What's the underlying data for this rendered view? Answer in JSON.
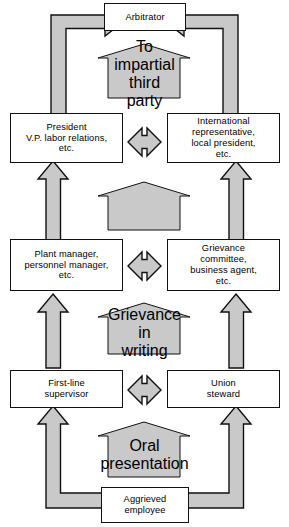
{
  "diagram": {
    "colors": {
      "fill": "#c9c9c9",
      "stroke": "#111111",
      "box_fill": "#ffffff",
      "text": "#000000"
    },
    "boxes": [
      {
        "id": "arbitrator",
        "label": "Arbitrator",
        "lines": [
          "Arbitrator"
        ]
      },
      {
        "id": "president",
        "label": "President V.P. labor relations, etc.",
        "lines": [
          "President",
          "V.P. labor relations,",
          "etc."
        ]
      },
      {
        "id": "international",
        "label": "International representative, local president, etc.",
        "lines": [
          "International",
          "representative,",
          "local president,",
          "etc."
        ]
      },
      {
        "id": "plant-manager",
        "label": "Plant manager, personnel manager, etc.",
        "lines": [
          "Plant manager,",
          "personnel manager,",
          "etc."
        ]
      },
      {
        "id": "grievance-committee",
        "label": "Grievance committee, business agent, etc.",
        "lines": [
          "Grievance",
          "committee,",
          "business agent,",
          "etc."
        ]
      },
      {
        "id": "first-line-supervisor",
        "label": "First-line supervisor",
        "lines": [
          "First-line",
          "supervisor"
        ]
      },
      {
        "id": "union-steward",
        "label": "Union steward",
        "lines": [
          "Union",
          "steward"
        ]
      },
      {
        "id": "aggrieved-employee",
        "label": "Aggrieved employee",
        "lines": [
          "Aggrieved",
          "employee"
        ]
      }
    ],
    "stages": [
      {
        "id": "to-impartial-third-party",
        "label": "To impartial third party",
        "lines": [
          "To",
          "impartial",
          "third",
          "party"
        ]
      },
      {
        "id": "stage-blank",
        "label": "",
        "lines": []
      },
      {
        "id": "grievance-in-writing",
        "label": "Grievance in writing",
        "lines": [
          "Grievance",
          "in",
          "writing"
        ]
      },
      {
        "id": "oral-presentation",
        "label": "Oral presentation",
        "lines": [
          "Oral",
          "presentation"
        ]
      }
    ]
  }
}
